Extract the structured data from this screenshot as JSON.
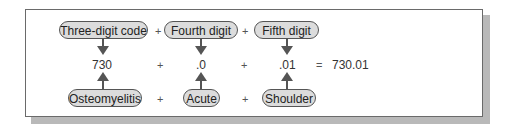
{
  "diagram": {
    "top_labels": [
      "Three-digit code",
      "Fourth digit",
      "Fifth digit"
    ],
    "codes": [
      "730",
      ".0",
      ".01"
    ],
    "bottom_labels": [
      "Osteomyelitis",
      "Acute",
      "Shoulder"
    ],
    "operators": {
      "plus": "+",
      "equals": "="
    },
    "result": "730.01"
  }
}
